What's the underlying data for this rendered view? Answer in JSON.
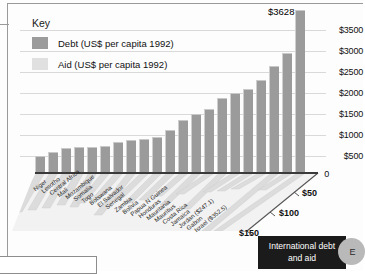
{
  "frame": {
    "caption_line1": "International debt",
    "caption_line2": "and aid",
    "badge_letter": "E"
  },
  "legend": {
    "title": "Key",
    "items": [
      {
        "label": "Debt (US$ per capita 1992)",
        "color": "#9b9b9b",
        "name": "debt"
      },
      {
        "label": "Aid (US$ per capita 1992)",
        "color": "#e0e0e0",
        "name": "aid"
      }
    ]
  },
  "peak_label": "$3628",
  "y_axis": {
    "ticks": [
      "$3500",
      "$3000",
      "$2500",
      "$2000",
      "$1500",
      "$1000",
      "$500",
      "0"
    ]
  },
  "aid_axis": {
    "ticks": [
      "$50",
      "$100",
      "$150"
    ]
  },
  "chart_data": {
    "type": "bar",
    "title": "International debt and aid",
    "xlabel": "",
    "ylabel": "US$ per capita 1992",
    "ylim": [
      0,
      3700
    ],
    "grid": true,
    "legend_position": "top-left",
    "categories": [
      "Niger",
      "Lesotho",
      "Central Africa",
      "Mali",
      "Mozambique",
      "Somalia",
      "Togo",
      "Botswana",
      "El Salvador",
      "Senegal",
      "Zambia",
      "Bolivia",
      "Papua N Guinea",
      "Honduras",
      "Mauritania",
      "Mauritius",
      "Costa Rica",
      "Jamaica",
      "Jordan ($247.1)",
      "Gabon",
      "Israel ($352.5)"
    ],
    "series": [
      {
        "name": "Debt (US$ per capita 1992)",
        "values": [
          150,
          185,
          225,
          235,
          235,
          240,
          285,
          300,
          310,
          330,
          395,
          490,
          545,
          595,
          700,
          740,
          780,
          860,
          1000,
          1120,
          1520
        ]
      },
      {
        "name": "Aid (US$ per capita 1992)",
        "values": [
          52,
          48,
          46,
          40,
          44,
          38,
          34,
          60,
          32,
          40,
          36,
          30,
          44,
          28,
          50,
          24,
          22,
          20,
          247.1,
          26,
          352.5
        ]
      }
    ],
    "annotations": [
      {
        "text": "$3628",
        "target": "Israel ($352.5)",
        "position": "above-bar"
      }
    ]
  }
}
